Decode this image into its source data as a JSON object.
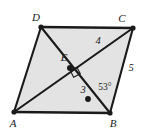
{
  "figure": {
    "type": "geometry-diagram",
    "shape": "parallelogram",
    "colors": {
      "fill": "#e3e3e3",
      "stroke": "#1a1a1a",
      "label": "#1a1a1a",
      "background": "#ffffff"
    },
    "vertices": [
      {
        "id": "A",
        "label": "A",
        "x": 14,
        "y": 112,
        "label_x": 13,
        "label_y": 123
      },
      {
        "id": "B",
        "label": "B",
        "x": 110,
        "y": 113,
        "label_x": 113,
        "label_y": 123
      },
      {
        "id": "C",
        "label": "C",
        "x": 133,
        "y": 28,
        "label_x": 122,
        "label_y": 18
      },
      {
        "id": "D",
        "label": "D",
        "x": 41,
        "y": 27,
        "label_x": 36,
        "label_y": 17
      }
    ],
    "interior_point": {
      "id": "E",
      "label": "E",
      "x": 70,
      "y": 68,
      "label_x": 64,
      "label_y": 57
    },
    "marked_point": {
      "id": "dot",
      "label": "",
      "x": 88,
      "y": 99
    },
    "sides": [
      {
        "from": "D",
        "to": "C",
        "name": "side-dc"
      },
      {
        "from": "C",
        "to": "B",
        "name": "side-cb"
      },
      {
        "from": "B",
        "to": "A",
        "name": "side-ba"
      },
      {
        "from": "A",
        "to": "D",
        "name": "side-ad"
      }
    ],
    "diagonals": [
      {
        "from": "A",
        "to": "C",
        "name": "diagonal-ac"
      },
      {
        "from": "D",
        "to": "B",
        "name": "diagonal-db"
      }
    ],
    "right_angle_marker": {
      "at": "E",
      "x": 74,
      "y": 72,
      "size": 7,
      "rotation": -27
    },
    "measures": [
      {
        "id": "m4",
        "value": "4",
        "x": 98,
        "y": 41,
        "refers_to": "segment-EC"
      },
      {
        "id": "m5",
        "value": "5",
        "x": 131,
        "y": 68,
        "refers_to": "side-BC"
      },
      {
        "id": "m3",
        "value": "3",
        "x": 83,
        "y": 90,
        "refers_to": "segment-EB-region"
      }
    ],
    "angles": [
      {
        "id": "a53",
        "value": "53°",
        "x": 105,
        "y": 88,
        "vertex": "B",
        "refers_to": "angle-EBC"
      }
    ]
  }
}
